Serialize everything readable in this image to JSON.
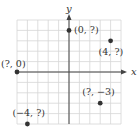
{
  "diagram": {
    "type": "coordinate-plane",
    "axes": {
      "x_label": "x",
      "y_label": "y"
    },
    "grid": {
      "x_min": -5,
      "x_max": 5,
      "y_min": -5,
      "y_max": 5,
      "origin_px": [
        69,
        72
      ],
      "unit_px": 10.4
    },
    "colors": {
      "grid": "#d6d6d6",
      "axis": "#444444",
      "point": "#333333",
      "text": "#333333"
    },
    "points": [
      {
        "x": 0,
        "y": 4,
        "label": "(0, ?)",
        "label_dx": 5,
        "label_dy": 3
      },
      {
        "x": 4,
        "y": 3,
        "label": "(4, ?)",
        "label_dx": -12,
        "label_dy": 14
      },
      {
        "x": -5,
        "y": 0,
        "label": "(?, 0)",
        "label_dx": -16,
        "label_dy": -5
      },
      {
        "x": 3,
        "y": -3,
        "label": "(?, −3)",
        "label_dx": -18,
        "label_dy": -8
      },
      {
        "x": -4,
        "y": -5,
        "label": "(−4, ?)",
        "label_dx": -15,
        "label_dy": -8
      }
    ]
  }
}
